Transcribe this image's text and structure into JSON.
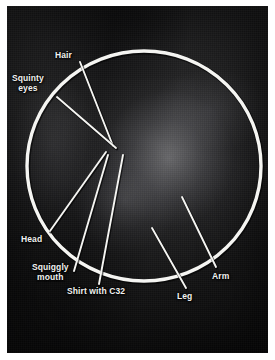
{
  "figure": {
    "name": "annotated-photograph",
    "media": "black and white photograph with hand-drawn white circle and leader lines",
    "background_color": "#ffffff",
    "plate_color": "#1f1f20",
    "overlay_color": "#f5f5f2"
  },
  "highlight_circle": {
    "name": "circled-region",
    "cx": 144,
    "cy": 166,
    "r": 116,
    "stroke": "#f5f5f2",
    "stroke_width": 3.4
  },
  "annotations": [
    {
      "id": "hair",
      "label": "Hair",
      "label_x": 55,
      "label_y": 50,
      "align": "left",
      "line": {
        "x1": 80,
        "y1": 62,
        "x2": 113,
        "y2": 146
      }
    },
    {
      "id": "squinty-eyes",
      "label": "Squinty\neyes",
      "label_x": 12,
      "label_y": 73,
      "align": "center",
      "line": {
        "x1": 57,
        "y1": 97,
        "x2": 116,
        "y2": 148
      }
    },
    {
      "id": "head",
      "label": "Head",
      "label_x": 21,
      "label_y": 234,
      "align": "left",
      "line": {
        "x1": 106,
        "y1": 152,
        "x2": 50,
        "y2": 231
      }
    },
    {
      "id": "squiggly-mouth",
      "label": "Squiggly\nmouth",
      "label_x": 32,
      "label_y": 262,
      "align": "center",
      "line": {
        "x1": 108,
        "y1": 155,
        "x2": 74,
        "y2": 271
      }
    },
    {
      "id": "shirt-with-c32",
      "label": "Shirt with C32",
      "label_x": 67,
      "label_y": 286,
      "align": "left",
      "line": {
        "x1": 123,
        "y1": 155,
        "x2": 99,
        "y2": 284
      }
    },
    {
      "id": "leg",
      "label": "Leg",
      "label_x": 177,
      "label_y": 291,
      "align": "left",
      "line": {
        "x1": 152,
        "y1": 228,
        "x2": 186,
        "y2": 288
      }
    },
    {
      "id": "arm",
      "label": "Arm",
      "label_x": 212,
      "label_y": 271,
      "align": "left",
      "line": {
        "x1": 182,
        "y1": 197,
        "x2": 216,
        "y2": 267
      }
    }
  ]
}
